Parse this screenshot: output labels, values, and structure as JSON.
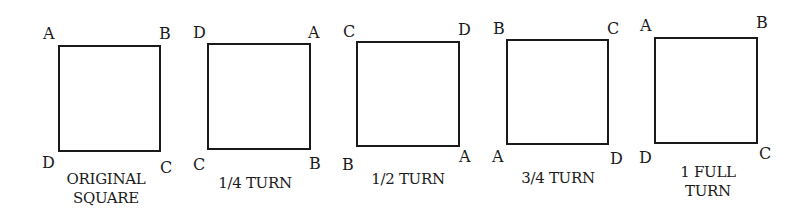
{
  "diagram": {
    "figures": [
      {
        "caption_lines": [
          "ORIGINAL",
          "SQUARE"
        ],
        "corners": {
          "top_left": "A",
          "top_right": "B",
          "bottom_left": "D",
          "bottom_right": "C"
        }
      },
      {
        "caption_lines": [
          "1/4 TURN"
        ],
        "corners": {
          "top_left": "D",
          "top_right": "A",
          "bottom_left": "C",
          "bottom_right": "B"
        }
      },
      {
        "caption_lines": [
          "1/2 TURN"
        ],
        "corners": {
          "top_left": "C",
          "top_right": "D",
          "bottom_left": "B",
          "bottom_right": "A"
        }
      },
      {
        "caption_lines": [
          "3/4 TURN"
        ],
        "corners": {
          "top_left": "B",
          "top_right": "C",
          "bottom_left": "A",
          "bottom_right": "D"
        }
      },
      {
        "caption_lines": [
          "1 FULL",
          "TURN"
        ],
        "corners": {
          "top_left": "A",
          "top_right": "B",
          "bottom_left": "D",
          "bottom_right": "C"
        }
      }
    ],
    "colors": {
      "stroke": "#1a1a1a",
      "background": "#ffffff"
    }
  }
}
